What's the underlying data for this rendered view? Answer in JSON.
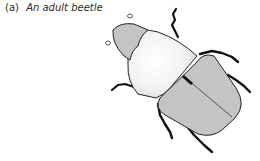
{
  "figure": {
    "label": "(a)",
    "title": "An adult beetle",
    "colors": {
      "body_fill": "#c4c4c4",
      "pronotum_fill": "#f4f4f4",
      "outline": "#222222",
      "legs": "#111111"
    }
  }
}
